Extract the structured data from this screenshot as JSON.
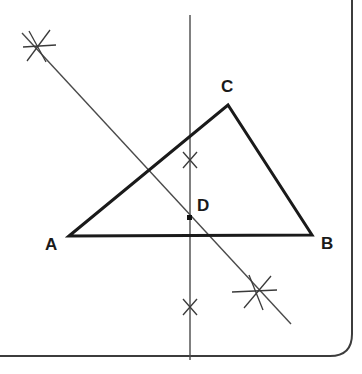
{
  "figure": {
    "type": "geometry-construction",
    "canvas": {
      "width": 362,
      "height": 374,
      "background": "#ffffff"
    },
    "colors": {
      "triangle_stroke": "#1a1a1a",
      "construction_stroke": "#4a4a4a",
      "label_text": "#1a1a1a",
      "page_border": "#3c3c3c",
      "point_marker": "#111111"
    },
    "labels": {
      "a": "A",
      "b": "B",
      "c": "C",
      "d": "D"
    },
    "points": [
      {
        "name": "A",
        "label": "A",
        "x": 69,
        "y": 236,
        "role": "triangle-vertex"
      },
      {
        "name": "B",
        "label": "B",
        "x": 312,
        "y": 235,
        "role": "triangle-vertex"
      },
      {
        "name": "C",
        "label": "C",
        "x": 228,
        "y": 105,
        "role": "triangle-vertex"
      },
      {
        "name": "D",
        "label": "D",
        "x": 190,
        "y": 218,
        "role": "intersection-point"
      }
    ],
    "triangle": {
      "stroke_width": 3,
      "vertices": "69,236 228,105 312,235"
    },
    "vertical_line": {
      "name": "perpendicular-bisector",
      "x1": 190,
      "y1": 15,
      "x2": 190,
      "y2": 360,
      "stroke_width": 1.4
    },
    "diagonal_line": {
      "name": "angle-bisector-or-second-construction-line",
      "x1": 22,
      "y1": 33,
      "x2": 291,
      "y2": 324,
      "stroke_width": 1.4
    },
    "arc_marks": [
      {
        "name": "arc-mark-top-left",
        "x": 38,
        "y": 46,
        "style": "star",
        "size": 30
      },
      {
        "name": "arc-mark-bottom-right",
        "x": 257,
        "y": 292,
        "style": "star",
        "size": 30
      },
      {
        "name": "arc-mark-upper-center",
        "x": 190,
        "y": 160,
        "style": "cross",
        "size": 15
      },
      {
        "name": "arc-mark-lower-center",
        "x": 190,
        "y": 307,
        "style": "cross",
        "size": 15
      }
    ],
    "page_border": {
      "name": "page-edge",
      "right_x": 352,
      "bottom_y": 356,
      "corner_radius": 22,
      "stroke_width": 2
    }
  }
}
